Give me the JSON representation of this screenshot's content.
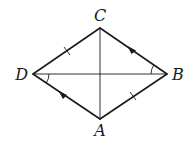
{
  "figure": {
    "type": "rhombus-with-diagonals",
    "vertices": {
      "C": {
        "label": "C"
      },
      "B": {
        "label": "B"
      },
      "A": {
        "label": "A"
      },
      "D": {
        "label": "D"
      }
    },
    "sides": [
      {
        "from": "D",
        "to": "C",
        "marking": "tick"
      },
      {
        "from": "C",
        "to": "B",
        "marking": "arrow"
      },
      {
        "from": "B",
        "to": "A",
        "marking": "tick"
      },
      {
        "from": "A",
        "to": "D",
        "marking": "arrow"
      }
    ],
    "diagonals": [
      {
        "from": "C",
        "to": "A"
      },
      {
        "from": "D",
        "to": "B"
      }
    ],
    "angle_marks": [
      {
        "vertex": "D",
        "between": [
          "B",
          "A"
        ]
      },
      {
        "vertex": "B",
        "between": [
          "D",
          "C"
        ]
      }
    ],
    "color": "#1a1a1a"
  }
}
